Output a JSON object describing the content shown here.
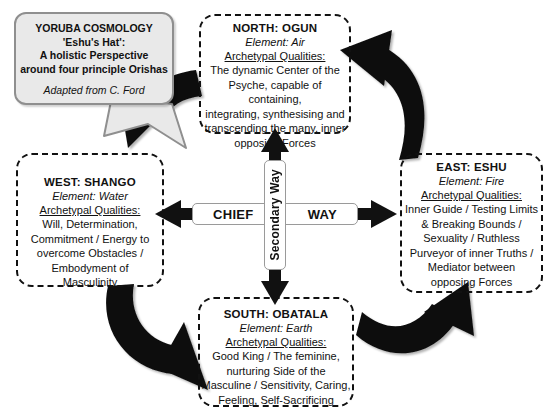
{
  "callout": {
    "title_lines": [
      "YORUBA COSMOLOGY",
      "'Eshu's Hat':",
      "A holistic Perspective",
      "around four principle Orishas"
    ],
    "credit": "Adapted from C. Ford"
  },
  "center": {
    "chief_left": "CHIEF",
    "chief_right": "WAY",
    "secondary": "Secondary Way"
  },
  "quadrants": {
    "north": {
      "title": "NORTH: OGUN",
      "element": "Element: Air",
      "qualities_label": "Archetypal Qualities:",
      "body_lines": [
        "The dynamic Center of the",
        "Psyche, capable of containing,",
        "integrating, synthesising  and",
        "transcending  the many, inner",
        "opposing  Forces"
      ]
    },
    "east": {
      "title": "EAST: ESHU",
      "element": "Element: Fire",
      "qualities_label": "Archetypal Qualities:",
      "body_lines": [
        "Inner Guide / Testing Limits",
        "&  Breaking  Bounds /",
        "Sexuality / Ruthless",
        "Purveyor of inner Truths /",
        "Mediator between",
        "opposing  Forces"
      ]
    },
    "west": {
      "title": "WEST: SHANGO",
      "element": "Element: Water",
      "qualities_label": "Archetypal Qualities:",
      "body_lines": [
        "Will, Determination,",
        "Commitment / Energy to",
        "overcome  Obstacles /",
        "Embodyment of",
        "Masculinity"
      ]
    },
    "south": {
      "title": "SOUTH: OBATALA",
      "element": "Element: Earth",
      "qualities_label": "Archetypal Qualities:",
      "body_lines": [
        "Good King / The feminine,",
        "nurturing Side of  the",
        "Masculine / Sensitivity, Caring,",
        "Feeling, Self-Sacrificing"
      ]
    }
  },
  "colors": {
    "callout_fill": "#e9e9e9",
    "callout_border": "#8f8f8f",
    "box_border": "#111111",
    "arrow_fill": "#111111",
    "background": "#ffffff"
  }
}
